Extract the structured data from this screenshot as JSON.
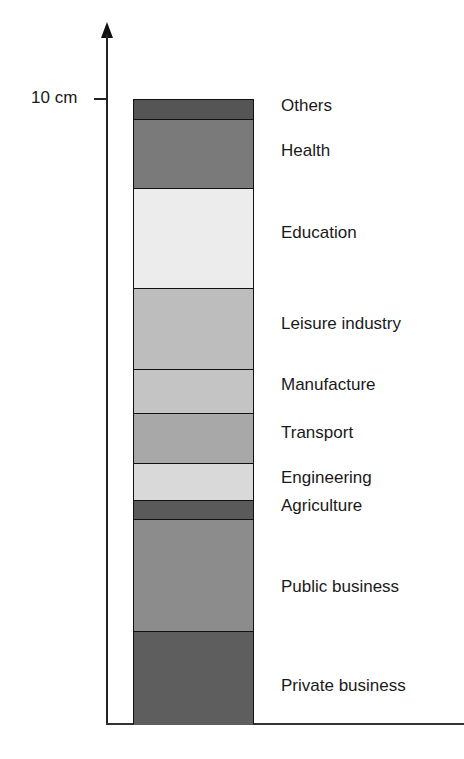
{
  "chart_data": {
    "type": "bar",
    "subtype": "stacked-single-column",
    "title": "",
    "xlabel": "",
    "ylabel": "",
    "ylim": [
      0,
      10
    ],
    "y_ticks": [
      {
        "value": 10,
        "label": "10 cm"
      }
    ],
    "grid": false,
    "legend_position": "inline-right",
    "categories": [
      "Total"
    ],
    "series": [
      {
        "name": "Private business",
        "values": [
          1.5
        ],
        "color": "#5e5e5e"
      },
      {
        "name": "Public business",
        "values": [
          1.8
        ],
        "color": "#8c8c8c"
      },
      {
        "name": "Agriculture",
        "values": [
          0.3
        ],
        "color": "#5a5a5a"
      },
      {
        "name": "Engineering",
        "values": [
          0.6
        ],
        "color": "#d9d9d9"
      },
      {
        "name": "Transport",
        "values": [
          0.8
        ],
        "color": "#a8a8a8"
      },
      {
        "name": "Manufacture",
        "values": [
          0.7
        ],
        "color": "#c4c4c4"
      },
      {
        "name": "Leisure industry",
        "values": [
          1.3
        ],
        "color": "#bdbdbd"
      },
      {
        "name": "Education",
        "values": [
          1.6
        ],
        "color": "#ececec"
      },
      {
        "name": "Health",
        "values": [
          1.1
        ],
        "color": "#7a7a7a"
      },
      {
        "name": "Others",
        "values": [
          0.3
        ],
        "color": "#555555"
      }
    ]
  },
  "axis": {
    "tick_label": "10 cm"
  },
  "labels": [
    {
      "text": "Others",
      "y": 96
    },
    {
      "text": "Health",
      "y": 141
    },
    {
      "text": "Education",
      "y": 223
    },
    {
      "text": "Leisure industry",
      "y": 314
    },
    {
      "text": "Manufacture",
      "y": 375
    },
    {
      "text": "Transport",
      "y": 423
    },
    {
      "text": "Engineering",
      "y": 468
    },
    {
      "text": "Agriculture",
      "y": 496
    },
    {
      "text": "Public business",
      "y": 577
    },
    {
      "text": "Private business",
      "y": 676
    }
  ]
}
